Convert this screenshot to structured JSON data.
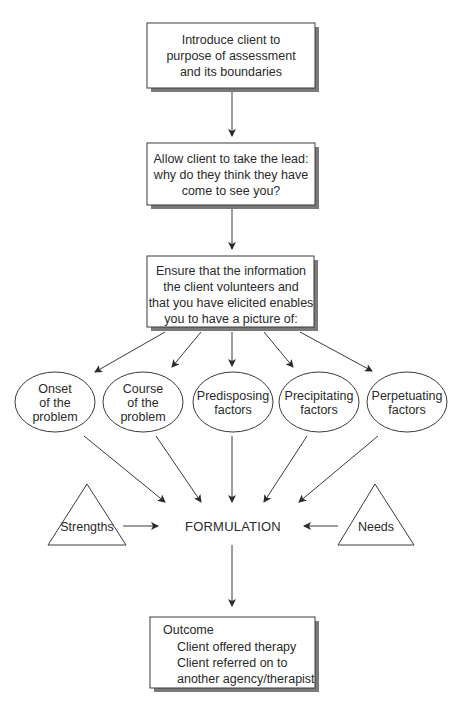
{
  "diagram": {
    "type": "flowchart",
    "colors": {
      "stroke": "#3a3a3a",
      "shadow": "#7a7a7a",
      "text": "#2a2a2a",
      "background": "#ffffff"
    },
    "boxes": {
      "introduce": {
        "lines": [
          "Introduce client to",
          "purpose of assessment",
          "and its boundaries"
        ]
      },
      "allow_lead": {
        "lines": [
          "Allow client to take the lead:",
          "why do they think they have",
          "come to see you?"
        ]
      },
      "ensure_info": {
        "lines": [
          "Ensure that the information",
          "the client volunteers and",
          "that you have elicited enables",
          "you to have a picture of:"
        ]
      },
      "outcome": {
        "title": "Outcome",
        "lines": [
          "Client offered therapy",
          "Client referred on to",
          "another agency/therapist"
        ]
      }
    },
    "factors": [
      {
        "id": "onset",
        "lines": [
          "Onset",
          "of the",
          "problem"
        ]
      },
      {
        "id": "course",
        "lines": [
          "Course",
          "of the",
          "problem"
        ]
      },
      {
        "id": "predisposing",
        "lines": [
          "Predisposing",
          "factors"
        ]
      },
      {
        "id": "precipitating",
        "lines": [
          "Precipitating",
          "factors"
        ]
      },
      {
        "id": "perpetuating",
        "lines": [
          "Perpetuating",
          "factors"
        ]
      }
    ],
    "triangles": {
      "strengths": {
        "label": "Strengths"
      },
      "needs": {
        "label": "Needs"
      }
    },
    "center": {
      "label": "FORMULATION"
    }
  }
}
